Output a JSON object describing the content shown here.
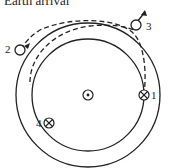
{
  "title": "Earth arrival",
  "diagram": {
    "center_symbol": "sun-dot",
    "orbits": [
      "inner-orbit",
      "outer-orbit"
    ],
    "points": [
      {
        "id": "1",
        "label": "1",
        "marker": "crossed-circle"
      },
      {
        "id": "2",
        "label": "2",
        "marker": "open-circle"
      },
      {
        "id": "3",
        "label": "3",
        "marker": "open-circle"
      },
      {
        "id": "4",
        "label": "4",
        "marker": "crossed-circle"
      }
    ],
    "trajectories": [
      "dashed-transfer-1-to-3",
      "dashed-transfer-4-to-2"
    ]
  }
}
